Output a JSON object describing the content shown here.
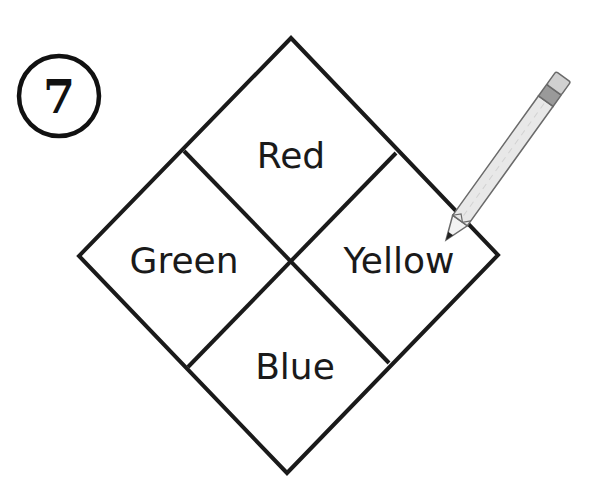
{
  "puzzle": {
    "number": "7",
    "regions": [
      {
        "position": "top",
        "label": "Red"
      },
      {
        "position": "left",
        "label": "Green"
      },
      {
        "position": "right",
        "label": "Yellow"
      },
      {
        "position": "bottom",
        "label": "Blue"
      }
    ]
  },
  "icons": {
    "number_badge": "circled-number-icon",
    "pencil": "pencil-icon"
  },
  "colors": {
    "stroke": "#1a1a1a",
    "background": "#ffffff",
    "pencil_body": "#e6e6e6",
    "pencil_ferrule": "#9a9a9a",
    "pencil_eraser": "#cfcfcf"
  }
}
